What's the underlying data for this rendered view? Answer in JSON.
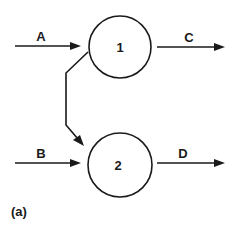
{
  "diagram": {
    "panel_label": "(a)",
    "nodes": [
      {
        "id": "1",
        "label": "1"
      },
      {
        "id": "2",
        "label": "2"
      }
    ],
    "edges": [
      {
        "label": "A",
        "from": "input",
        "to": "1"
      },
      {
        "label": "C",
        "from": "1",
        "to": "output"
      },
      {
        "label": "B",
        "from": "input",
        "to": "2"
      },
      {
        "label": "D",
        "from": "2",
        "to": "output"
      },
      {
        "label": "",
        "from": "1",
        "to": "2"
      }
    ],
    "colors": {
      "stroke": "#1a1a1a",
      "background": "#ffffff"
    }
  }
}
